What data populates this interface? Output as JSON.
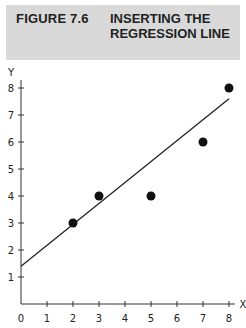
{
  "header": {
    "figure_label": "FIGURE 7.6",
    "figure_title": "INSERTING THE REGRESSION LINE"
  },
  "chart_data": {
    "type": "scatter",
    "title": "Inserting the Regression Line",
    "xlabel": "X",
    "ylabel": "Y",
    "xlim": [
      0,
      8
    ],
    "ylim": [
      0,
      8
    ],
    "xticks": [
      0,
      1,
      2,
      3,
      4,
      5,
      6,
      7,
      8
    ],
    "yticks": [
      1,
      2,
      3,
      4,
      5,
      6,
      7,
      8
    ],
    "grid": false,
    "points": [
      {
        "x": 2,
        "y": 3
      },
      {
        "x": 3,
        "y": 4
      },
      {
        "x": 5,
        "y": 4
      },
      {
        "x": 7,
        "y": 6
      },
      {
        "x": 8,
        "y": 8
      }
    ],
    "regression_line": {
      "x0": 0,
      "y0": 1.4,
      "x1": 8,
      "y1": 7.6
    }
  }
}
